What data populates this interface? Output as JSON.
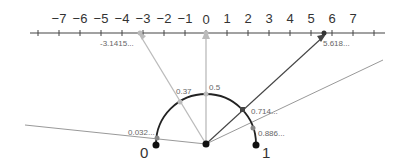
{
  "number_line": {
    "ticks": [
      "−7",
      "−6",
      "−5",
      "−4",
      "−3",
      "−2",
      "−1",
      "0",
      "1",
      "2",
      "3",
      "4",
      "5",
      "6",
      "7"
    ],
    "zero_px": 206,
    "unit_px": 21,
    "y": 33
  },
  "points_on_line": [
    {
      "label": "-3.1415...",
      "value": -3.1415,
      "color": "#b0b0b0"
    },
    {
      "label": "5.618...",
      "value": 5.618,
      "color": "#333333"
    }
  ],
  "semicircle": {
    "center": [
      206,
      144
    ],
    "radius": 50,
    "endpoint_labels": {
      "left": "0",
      "right": "1"
    }
  },
  "arc_points": [
    {
      "label": "0.032...",
      "t": 0.032
    },
    {
      "label": "0.37",
      "t": 0.37
    },
    {
      "label": "0.5",
      "t": 0.5
    },
    {
      "label": "0.714...",
      "t": 0.714
    },
    {
      "label": "0.886...",
      "t": 0.886
    }
  ]
}
